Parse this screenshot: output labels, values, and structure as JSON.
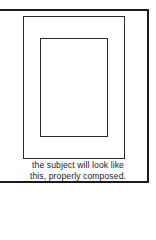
{
  "diagram": {
    "caption": {
      "line1": "the subject will look like",
      "line2": "this, properly composed."
    },
    "shapes": [
      {
        "name": "outer-frame",
        "type": "rectangle"
      },
      {
        "name": "middle-rectangle",
        "type": "rectangle"
      },
      {
        "name": "inner-rectangle",
        "type": "rectangle"
      }
    ],
    "colors": {
      "stroke": "#1a1a1a",
      "background": "#ffffff"
    }
  }
}
